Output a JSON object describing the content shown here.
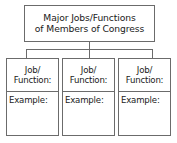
{
  "diagram": {
    "type": "graphic-organizer",
    "title_box": {
      "lines": [
        "Major Jobs/Functions",
        "of Members of Congress"
      ]
    },
    "columns": [
      {
        "job_lines": [
          "Job/",
          "Function:"
        ],
        "example_label": "Example:"
      },
      {
        "job_lines": [
          "Job/",
          "Function:"
        ],
        "example_label": "Example:"
      },
      {
        "job_lines": [
          "Job/",
          "Function:"
        ],
        "example_label": "Example:"
      }
    ],
    "colors": {
      "border": "#6b6b6b",
      "background": "#ffffff",
      "text": "#1a1a1a"
    }
  }
}
